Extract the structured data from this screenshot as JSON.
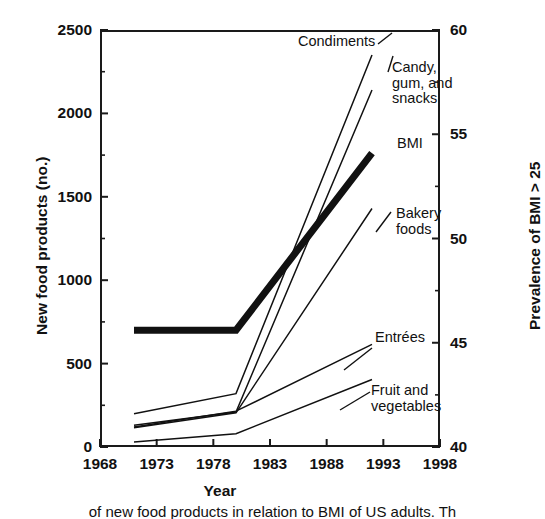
{
  "chart_data": {
    "type": "line",
    "title": "",
    "xlabel": "Year",
    "ylabel": "New food products (no.)",
    "ylabel_right": "Prevalence of BMI > 25",
    "xlim": [
      1968,
      1998
    ],
    "ylim": [
      0,
      2500
    ],
    "ylim_right": [
      40,
      60
    ],
    "xticks": [
      "1968",
      "1973",
      "1978",
      "1983",
      "1988",
      "1993",
      "1998"
    ],
    "yticks": [
      "0",
      "500",
      "1000",
      "1500",
      "2000",
      "2500"
    ],
    "yticks_right": [
      "40",
      "45",
      "50",
      "55",
      "60"
    ],
    "minor_ticks": true,
    "grid": false,
    "legend": "inline annotations at line ends",
    "series": [
      {
        "name": "Condiments",
        "axis": "left",
        "style": "thin",
        "x": [
          1971,
          1980,
          1992
        ],
        "values": [
          200,
          320,
          2350
        ]
      },
      {
        "name": "Candy, gum, and snacks",
        "axis": "left",
        "style": "thin",
        "x": [
          1971,
          1980,
          1992
        ],
        "values": [
          130,
          210,
          2140
        ]
      },
      {
        "name": "BMI",
        "axis": "right",
        "style": "thick",
        "x": [
          1971,
          1980,
          1992
        ],
        "values": [
          45.6,
          45.6,
          54.1
        ],
        "values_left_scale": [
          775,
          775,
          1820
        ]
      },
      {
        "name": "Bakery foods",
        "axis": "left",
        "style": "thin",
        "x": [
          1971,
          1980,
          1992
        ],
        "values": [
          115,
          205,
          1430
        ]
      },
      {
        "name": "Entrées",
        "axis": "left",
        "style": "thin",
        "x": [
          1971,
          1980,
          1992
        ],
        "values": [
          120,
          215,
          615
        ]
      },
      {
        "name": "Fruit and vegetables",
        "axis": "left",
        "style": "thin",
        "x": [
          1971,
          1980,
          1992
        ],
        "values": [
          30,
          80,
          405
        ]
      }
    ],
    "annotations": [
      {
        "id": "condiments",
        "text": "Condiments"
      },
      {
        "id": "candy",
        "text": "Candy,\ngum, and\nsnacks"
      },
      {
        "id": "bmi",
        "text": "BMI"
      },
      {
        "id": "bakery",
        "text": "Bakery\nfoods"
      },
      {
        "id": "entrees",
        "text": "Entrées"
      },
      {
        "id": "fruit",
        "text": "Fruit and\nvegetables"
      }
    ]
  },
  "caption": "of new food products in relation to BMI of US adults. Th"
}
